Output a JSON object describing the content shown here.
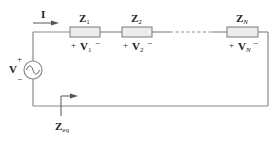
{
  "diagram": {
    "current_label": "I",
    "source": {
      "label": "V",
      "plus": "+",
      "minus": "−"
    },
    "impedances": [
      {
        "name": "Z",
        "sub": "1",
        "voltage": "V",
        "vsub": "1",
        "plus": "+",
        "minus": "−"
      },
      {
        "name": "Z",
        "sub": "2",
        "voltage": "V",
        "vsub": "2",
        "plus": "+",
        "minus": "−"
      },
      {
        "name": "Z",
        "sub": "N",
        "voltage": "V",
        "vsub": "N",
        "plus": "+",
        "minus": "−"
      }
    ],
    "equivalent": {
      "name": "Z",
      "sub": "eq"
    },
    "colors": {
      "wire": "#8a8a8a",
      "resistor_fill": "#ededed",
      "resistor_stroke": "#7a7a7a",
      "text": "#222222"
    }
  }
}
